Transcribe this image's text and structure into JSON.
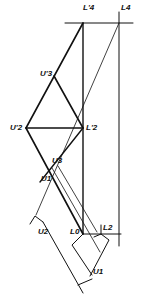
{
  "diagram": {
    "type": "descriptive-geometry construction",
    "line_color": "#111111",
    "background": "#ffffff",
    "labels": {
      "L4_prime": "L'4",
      "L4": "L4",
      "U3_prime": "U'3",
      "U2_prime": "U'2",
      "L2_prime": "L'2",
      "U3": "U3",
      "U1_upper": "U1",
      "U2": "U2",
      "L0": "L0",
      "L2": "L2",
      "U1_lower": "U1"
    }
  }
}
